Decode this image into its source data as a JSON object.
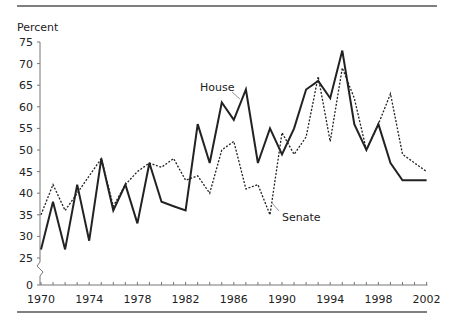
{
  "chart_data": {
    "type": "line",
    "title": "",
    "ylabel": "Percent",
    "xlabel": "",
    "ylim": [
      0,
      75
    ],
    "y_axis_break": [
      0,
      25
    ],
    "grid": false,
    "legend": "inline labels",
    "yticks": [
      0,
      25,
      30,
      35,
      40,
      45,
      50,
      55,
      60,
      65,
      70,
      75
    ],
    "xtick_labels": [
      "1970",
      "1974",
      "1978",
      "1982",
      "1986",
      "1990",
      "1994",
      "1998",
      "2002"
    ],
    "x": [
      1970,
      1971,
      1972,
      1973,
      1974,
      1975,
      1976,
      1977,
      1978,
      1979,
      1980,
      1981,
      1982,
      1983,
      1984,
      1985,
      1986,
      1987,
      1988,
      1989,
      1990,
      1991,
      1992,
      1993,
      1994,
      1995,
      1996,
      1997,
      1998,
      1999,
      2000,
      2001,
      2002
    ],
    "series": [
      {
        "name": "House",
        "style": "solid",
        "values": [
          27,
          38,
          27,
          42,
          29,
          48,
          36,
          42,
          33,
          47,
          38,
          37,
          36,
          56,
          47,
          61,
          57,
          64,
          47,
          55,
          49,
          55,
          64,
          66,
          62,
          73,
          56,
          50,
          56,
          47,
          43,
          43,
          43
        ]
      },
      {
        "name": "Senate",
        "style": "dotted",
        "values": [
          35,
          42,
          36,
          40,
          44,
          48,
          37,
          42,
          45,
          47,
          46,
          48,
          43,
          44,
          40,
          50,
          52,
          41,
          42,
          35,
          54,
          49,
          53,
          67,
          52,
          69,
          62,
          50,
          56,
          63,
          49,
          47,
          45
        ]
      }
    ]
  },
  "labels": {
    "y_axis_title": "Percent",
    "house": "House",
    "senate": "Senate"
  },
  "colors": {
    "line": "#222222",
    "rule": "#555555"
  }
}
